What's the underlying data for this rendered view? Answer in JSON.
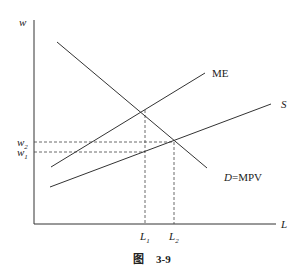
{
  "diagram": {
    "axes": {
      "y_label": "w",
      "x_label": "L"
    },
    "curves": [
      {
        "id": "D",
        "label_italic": "D",
        "label_rest": "=MPV"
      },
      {
        "id": "ME",
        "label": "ME"
      },
      {
        "id": "S",
        "label": "S"
      }
    ],
    "y_ticks": [
      {
        "base": "w",
        "sub": "2"
      },
      {
        "base": "w",
        "sub": "1"
      }
    ],
    "x_ticks": [
      {
        "base": "L",
        "sub": "1"
      },
      {
        "base": "L",
        "sub": "2"
      }
    ],
    "caption": {
      "prefix": "图",
      "number": "3-9"
    }
  }
}
